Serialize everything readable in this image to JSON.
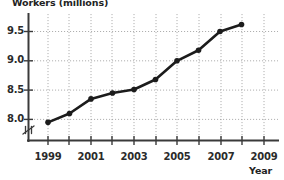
{
  "chart_data": {
    "type": "line",
    "title": "",
    "xlabel": "Year",
    "ylabel": "Workers (millions)",
    "x": [
      1999,
      2000,
      2001,
      2002,
      2003,
      2004,
      2005,
      2006,
      2007,
      2008
    ],
    "values": [
      7.95,
      8.1,
      8.35,
      8.45,
      8.51,
      8.68,
      9.0,
      9.18,
      9.5,
      9.62
    ],
    "series": [
      {
        "name": "Workers",
        "values": [
          7.95,
          8.1,
          8.35,
          8.45,
          8.51,
          8.68,
          9.0,
          9.18,
          9.5,
          9.62
        ]
      }
    ],
    "xlim": [
      1998,
      2009.5
    ],
    "ylim": [
      7.8,
      9.75
    ],
    "y_ticks": [
      8.0,
      8.5,
      9.0,
      9.5
    ],
    "y_tick_labels": [
      "8.0",
      "8.5",
      "9.0",
      "9.5"
    ],
    "x_ticks": [
      1999,
      2000,
      2001,
      2002,
      2003,
      2004,
      2005,
      2006,
      2007,
      2008,
      2009
    ],
    "x_tick_labels_major": [
      "1999",
      "2001",
      "2003",
      "2005",
      "2007",
      "2009"
    ],
    "x_major_years": [
      1999,
      2001,
      2003,
      2005,
      2007,
      2009
    ],
    "grid": true,
    "grid_style": "dotted",
    "legend": false,
    "legend_position": "none",
    "axis_break_y": true,
    "marker": "circle",
    "line_color": "#1c1c1c",
    "marker_color": "#1c1c1c",
    "grid_color": "#9a9a9a",
    "axis_color": "#3a3a3a",
    "background": "#ffffff",
    "annotations": []
  },
  "axes": {
    "y_title": "Workers (millions)",
    "x_title": "Year",
    "y_tick_labels": [
      "9.5",
      "9.0",
      "8.5",
      "8.0"
    ],
    "x_tick_labels": [
      "1999",
      "2001",
      "2003",
      "2005",
      "2007",
      "2009"
    ]
  }
}
